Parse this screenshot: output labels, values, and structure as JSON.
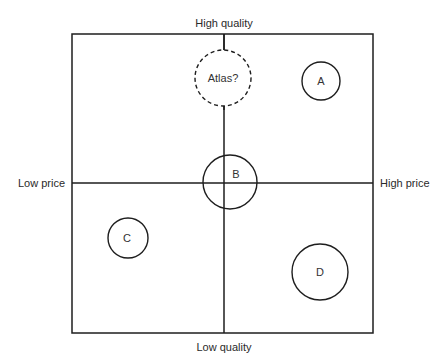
{
  "diagram": {
    "type": "perceptual map",
    "axes": {
      "top_label": "High quality",
      "bottom_label": "Low quality",
      "left_label": "Low price",
      "right_label": "High price"
    },
    "frame": {
      "left": 72,
      "top": 34,
      "right": 373,
      "bottom": 333,
      "center_x": 224,
      "center_y": 183
    },
    "brands": [
      {
        "id": "atlas",
        "label": "Atlas?",
        "cx": 223,
        "cy": 78,
        "r": 28,
        "dashed": true
      },
      {
        "id": "a",
        "label": "A",
        "cx": 321,
        "cy": 81,
        "r": 19,
        "dashed": false
      },
      {
        "id": "b",
        "label": "B",
        "cx": 230,
        "cy": 182,
        "r": 27,
        "dashed": false
      },
      {
        "id": "c",
        "label": "C",
        "cx": 128,
        "cy": 238,
        "r": 20,
        "dashed": false
      },
      {
        "id": "d",
        "label": "D",
        "cx": 320,
        "cy": 272,
        "r": 28,
        "dashed": false
      }
    ],
    "colors": {
      "line": "#1e1e1e",
      "text": "#2a2a2a",
      "background": "#ffffff"
    }
  }
}
